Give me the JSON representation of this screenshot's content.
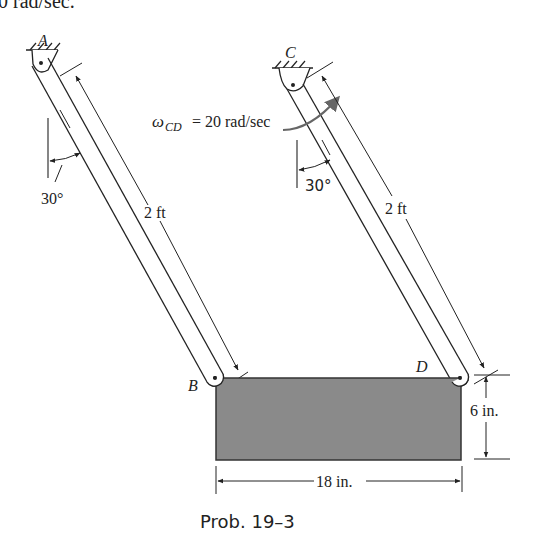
{
  "header_fragment": "0 rad/sec.",
  "points": {
    "A": "A",
    "B": "B",
    "C": "C",
    "D": "D"
  },
  "angular_velocity": {
    "symbol": "ω",
    "subscript": "CD",
    "value_text": "= 20 rad/sec"
  },
  "angles": {
    "left": "30°",
    "right": "30°"
  },
  "dimensions": {
    "link_AB_length": "2 ft",
    "link_CD_length": "2 ft",
    "plate_height": "6 in.",
    "plate_width": "18 in."
  },
  "caption": "Prob. 19–3",
  "colors": {
    "plate_fill": "#8a8a8a",
    "line": "#222222",
    "arrow": "#555555"
  }
}
